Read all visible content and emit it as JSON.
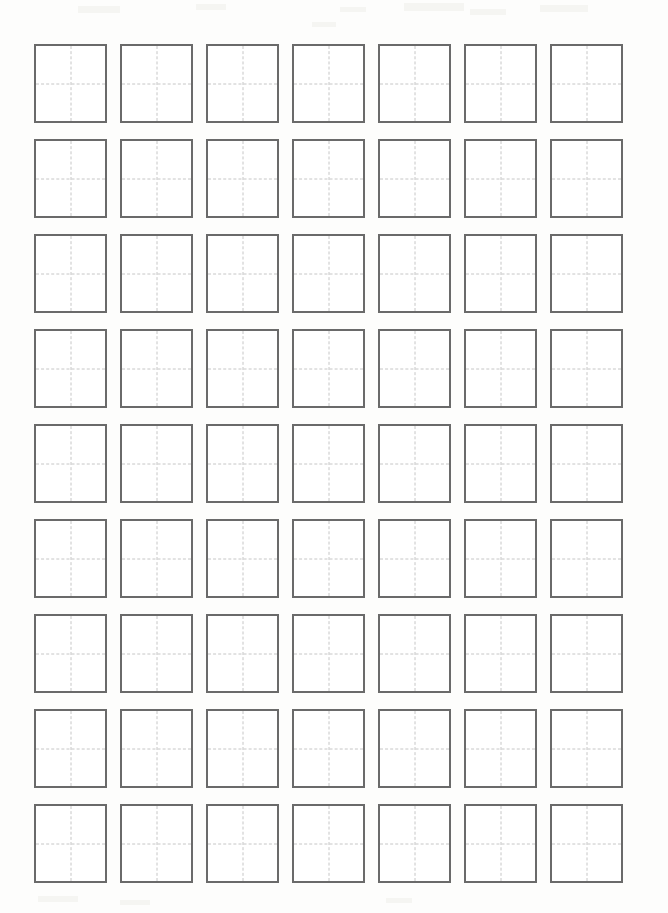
{
  "document": {
    "title": "Character Practice Grid Worksheet",
    "sheet_type": "blank-practice-grid",
    "paper_color": "#fdfdfc",
    "cell_fill_color": "#ffffff",
    "cell_border_color": "#6a6a6a",
    "guide_line_color": "#c6c6c6",
    "guide_line_style": "dashed"
  },
  "grid": {
    "columns": 7,
    "rows": 9,
    "total_cells": 63,
    "cell_width_px": 73,
    "cell_height_px": 79,
    "column_gap_px": 13,
    "row_gap_px": 16,
    "origin_x_px": 34,
    "origin_y_px": 44,
    "border_width_px": 2,
    "guides": [
      "vertical-center",
      "horizontal-center"
    ],
    "cells": [
      {
        "row": 1,
        "col": 1,
        "content": ""
      },
      {
        "row": 1,
        "col": 2,
        "content": ""
      },
      {
        "row": 1,
        "col": 3,
        "content": ""
      },
      {
        "row": 1,
        "col": 4,
        "content": ""
      },
      {
        "row": 1,
        "col": 5,
        "content": ""
      },
      {
        "row": 1,
        "col": 6,
        "content": ""
      },
      {
        "row": 1,
        "col": 7,
        "content": ""
      },
      {
        "row": 2,
        "col": 1,
        "content": ""
      },
      {
        "row": 2,
        "col": 2,
        "content": ""
      },
      {
        "row": 2,
        "col": 3,
        "content": ""
      },
      {
        "row": 2,
        "col": 4,
        "content": ""
      },
      {
        "row": 2,
        "col": 5,
        "content": ""
      },
      {
        "row": 2,
        "col": 6,
        "content": ""
      },
      {
        "row": 2,
        "col": 7,
        "content": ""
      },
      {
        "row": 3,
        "col": 1,
        "content": ""
      },
      {
        "row": 3,
        "col": 2,
        "content": ""
      },
      {
        "row": 3,
        "col": 3,
        "content": ""
      },
      {
        "row": 3,
        "col": 4,
        "content": ""
      },
      {
        "row": 3,
        "col": 5,
        "content": ""
      },
      {
        "row": 3,
        "col": 6,
        "content": ""
      },
      {
        "row": 3,
        "col": 7,
        "content": ""
      },
      {
        "row": 4,
        "col": 1,
        "content": ""
      },
      {
        "row": 4,
        "col": 2,
        "content": ""
      },
      {
        "row": 4,
        "col": 3,
        "content": ""
      },
      {
        "row": 4,
        "col": 4,
        "content": ""
      },
      {
        "row": 4,
        "col": 5,
        "content": ""
      },
      {
        "row": 4,
        "col": 6,
        "content": ""
      },
      {
        "row": 4,
        "col": 7,
        "content": ""
      },
      {
        "row": 5,
        "col": 1,
        "content": ""
      },
      {
        "row": 5,
        "col": 2,
        "content": ""
      },
      {
        "row": 5,
        "col": 3,
        "content": ""
      },
      {
        "row": 5,
        "col": 4,
        "content": ""
      },
      {
        "row": 5,
        "col": 5,
        "content": ""
      },
      {
        "row": 5,
        "col": 6,
        "content": ""
      },
      {
        "row": 5,
        "col": 7,
        "content": ""
      },
      {
        "row": 6,
        "col": 1,
        "content": ""
      },
      {
        "row": 6,
        "col": 2,
        "content": ""
      },
      {
        "row": 6,
        "col": 3,
        "content": ""
      },
      {
        "row": 6,
        "col": 4,
        "content": ""
      },
      {
        "row": 6,
        "col": 5,
        "content": ""
      },
      {
        "row": 6,
        "col": 6,
        "content": ""
      },
      {
        "row": 6,
        "col": 7,
        "content": ""
      },
      {
        "row": 7,
        "col": 1,
        "content": ""
      },
      {
        "row": 7,
        "col": 2,
        "content": ""
      },
      {
        "row": 7,
        "col": 3,
        "content": ""
      },
      {
        "row": 7,
        "col": 4,
        "content": ""
      },
      {
        "row": 7,
        "col": 5,
        "content": ""
      },
      {
        "row": 7,
        "col": 6,
        "content": ""
      },
      {
        "row": 7,
        "col": 7,
        "content": ""
      },
      {
        "row": 8,
        "col": 1,
        "content": ""
      },
      {
        "row": 8,
        "col": 2,
        "content": ""
      },
      {
        "row": 8,
        "col": 3,
        "content": ""
      },
      {
        "row": 8,
        "col": 4,
        "content": ""
      },
      {
        "row": 8,
        "col": 5,
        "content": ""
      },
      {
        "row": 8,
        "col": 6,
        "content": ""
      },
      {
        "row": 8,
        "col": 7,
        "content": ""
      },
      {
        "row": 9,
        "col": 1,
        "content": ""
      },
      {
        "row": 9,
        "col": 2,
        "content": ""
      },
      {
        "row": 9,
        "col": 3,
        "content": ""
      },
      {
        "row": 9,
        "col": 4,
        "content": ""
      },
      {
        "row": 9,
        "col": 5,
        "content": ""
      },
      {
        "row": 9,
        "col": 6,
        "content": ""
      },
      {
        "row": 9,
        "col": 7,
        "content": ""
      }
    ]
  }
}
